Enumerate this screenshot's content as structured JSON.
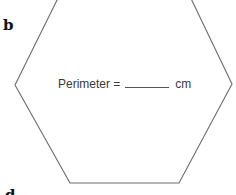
{
  "labels": {
    "part_b": "b",
    "part_d": "d"
  },
  "figure": {
    "shape": "hexagon",
    "stroke_color": "#6b6b6b",
    "vertices": [
      [
        64,
        -14
      ],
      [
        185,
        -14
      ],
      [
        232,
        84
      ],
      [
        179,
        183
      ],
      [
        70,
        183
      ],
      [
        15,
        85
      ]
    ]
  },
  "perimeter": {
    "prefix": "Perimeter =",
    "blank": "",
    "unit": "cm"
  }
}
